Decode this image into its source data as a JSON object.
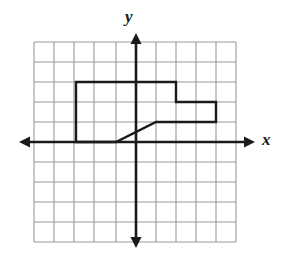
{
  "figure": {
    "background_color": "#ffffff",
    "axis_color": "#1a1a1a",
    "grid_color": "#9a9a9a",
    "shape_color": "#1a1a1a"
  },
  "axes": {
    "x_label": "x",
    "y_label": "y",
    "origin_px": {
      "x": 136,
      "y": 142
    },
    "unit_px": 20,
    "x_arrow_left_px": 19,
    "x_arrow_right_px": 255,
    "y_arrow_top_px": 33,
    "y_arrow_bottom_px": 248,
    "x_range_units": [
      -6,
      5
    ],
    "y_range_units": [
      -5,
      5
    ]
  },
  "grid": {
    "visible": true,
    "spacing_units": 1,
    "vertical_lines_px": [
      34,
      54,
      74,
      94,
      116,
      136,
      156,
      176,
      196,
      216,
      236
    ],
    "horizontal_lines_px": [
      42,
      62,
      82,
      102,
      122,
      142,
      162,
      182,
      202,
      222,
      242
    ]
  },
  "chart_data": {
    "type": "line",
    "xlabel": "x",
    "ylabel": "y",
    "xlim": [
      -6,
      5
    ],
    "ylim": [
      -5,
      5
    ],
    "grid": true,
    "legend": "none",
    "series": [
      {
        "name": "polygon",
        "closed": true,
        "x": [
          -3,
          -3,
          2,
          2,
          4,
          4,
          1,
          -1
        ],
        "y": [
          0,
          3,
          3,
          2,
          2,
          1,
          1,
          0
        ],
        "vertices": [
          [
            -3,
            0
          ],
          [
            -3,
            3
          ],
          [
            2,
            3
          ],
          [
            2,
            2
          ],
          [
            4,
            2
          ],
          [
            4,
            1
          ],
          [
            1,
            1
          ],
          [
            -1,
            0
          ]
        ]
      }
    ]
  }
}
